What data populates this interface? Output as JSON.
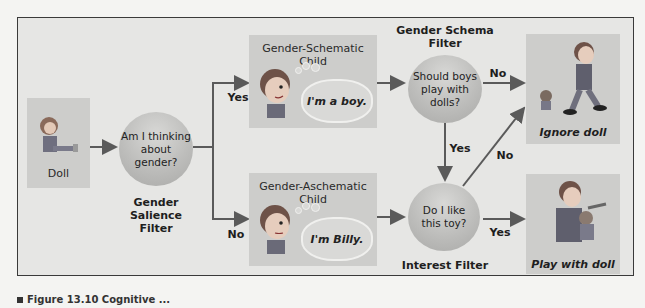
{
  "diagram": {
    "nodes": {
      "doll": {
        "label": "Doll"
      },
      "salience_filter": {
        "question_line1": "Am I thinking",
        "question_line2": "about gender?",
        "title_line1": "Gender Salience",
        "title_line2": "Filter"
      },
      "schematic_child": {
        "title": "Gender-Schematic Child",
        "thought": "I'm a boy."
      },
      "aschematic_child": {
        "title": "Gender-Aschematic Child",
        "thought": "I'm Billy."
      },
      "schema_filter": {
        "title_line1": "Gender Schema",
        "title_line2": "Filter",
        "question_line1": "Should boys",
        "question_line2": "play with dolls?"
      },
      "interest_filter": {
        "title": "Interest Filter",
        "question_line1": "Do I like",
        "question_line2": "this toy?"
      },
      "ignore_doll": {
        "label": "Ignore doll"
      },
      "play_with_doll": {
        "label": "Play with doll"
      }
    },
    "edges": {
      "salience_yes": "Yes",
      "salience_no": "No",
      "schema_no": "No",
      "schema_yes": "Yes",
      "interest_no": "No",
      "interest_yes": "Yes"
    }
  },
  "caption": {
    "text": "Figure 13.10  Cognitive ..."
  },
  "colors": {
    "frame_bg": "#e6e6e4",
    "box_bg": "#cdcdcb",
    "border": "#3a3a3a",
    "arrow": "#5a5a5a"
  }
}
